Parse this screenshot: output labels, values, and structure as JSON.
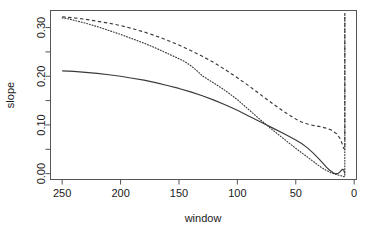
{
  "chart_data": {
    "type": "line",
    "title": "",
    "subtitle": "",
    "xlabel": "window",
    "ylabel": "slope",
    "xlim": [
      260,
      -2
    ],
    "ylim": [
      -0.012,
      0.335
    ],
    "x_reversed": true,
    "grid": false,
    "legend": "none",
    "x_ticks_major": [
      250,
      200,
      150,
      100,
      50,
      0
    ],
    "x_tick_labels": [
      "250",
      "200",
      "150",
      "100",
      "50",
      "0"
    ],
    "y_ticks_major": [
      0.0,
      0.1,
      0.2,
      0.3
    ],
    "y_tick_labels": [
      "0.00",
      "0.10",
      "0.20",
      "0.30"
    ],
    "y_ticks_minor": [
      0.05,
      0.15,
      0.25
    ],
    "series": [
      {
        "name": "upper-dashed",
        "style": "dashed",
        "color": "#3a3a3a",
        "x": [
          250,
          245,
          240,
          230,
          220,
          210,
          200,
          190,
          180,
          170,
          160,
          150,
          140,
          130,
          120,
          110,
          100,
          90,
          80,
          70,
          60,
          50,
          45,
          40,
          35,
          30,
          25,
          20,
          15,
          12,
          10,
          9,
          8,
          8
        ],
        "values": [
          0.322,
          0.321,
          0.32,
          0.317,
          0.313,
          0.309,
          0.304,
          0.298,
          0.291,
          0.283,
          0.274,
          0.264,
          0.253,
          0.241,
          0.228,
          0.213,
          0.197,
          0.18,
          0.162,
          0.144,
          0.127,
          0.112,
          0.106,
          0.102,
          0.099,
          0.097,
          0.094,
          0.09,
          0.082,
          0.072,
          0.06,
          0.052,
          0.05,
          0.33
        ]
      },
      {
        "name": "middle-dotted",
        "style": "dotted",
        "color": "#3a3a3a",
        "x": [
          250,
          245,
          240,
          230,
          220,
          210,
          200,
          190,
          180,
          170,
          160,
          150,
          145,
          140,
          135,
          130,
          125,
          120,
          110,
          100,
          90,
          80,
          70,
          60,
          50,
          45,
          40,
          35,
          30,
          25,
          20,
          15,
          12,
          10,
          9,
          8,
          8
        ],
        "values": [
          0.32,
          0.318,
          0.315,
          0.309,
          0.302,
          0.294,
          0.286,
          0.277,
          0.268,
          0.258,
          0.247,
          0.236,
          0.23,
          0.222,
          0.212,
          0.201,
          0.193,
          0.186,
          0.17,
          0.152,
          0.131,
          0.11,
          0.09,
          0.071,
          0.052,
          0.043,
          0.034,
          0.025,
          0.016,
          0.008,
          0.002,
          -0.002,
          -0.004,
          -0.005,
          -0.006,
          -0.006,
          0.33
        ]
      },
      {
        "name": "lower-solid",
        "style": "solid",
        "color": "#3a3a3a",
        "x": [
          250,
          240,
          230,
          220,
          210,
          200,
          190,
          180,
          170,
          160,
          150,
          140,
          130,
          120,
          110,
          100,
          90,
          80,
          70,
          60,
          50,
          45,
          40,
          35,
          30,
          27,
          24,
          21,
          18,
          16,
          14,
          12,
          10,
          9,
          8
        ],
        "values": [
          0.211,
          0.21,
          0.208,
          0.206,
          0.203,
          0.2,
          0.196,
          0.192,
          0.187,
          0.181,
          0.175,
          0.168,
          0.16,
          0.151,
          0.141,
          0.13,
          0.118,
          0.106,
          0.094,
          0.082,
          0.069,
          0.062,
          0.053,
          0.042,
          0.03,
          0.022,
          0.014,
          0.007,
          0.002,
          0.0,
          0.0,
          0.004,
          0.009,
          0.008,
          0.0
        ]
      }
    ]
  }
}
